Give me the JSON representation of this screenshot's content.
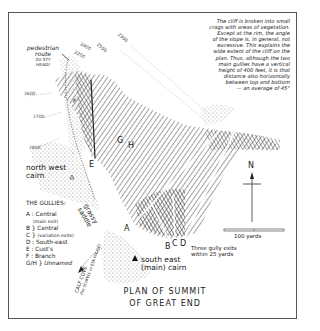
{
  "map": {
    "title_line1": "PLAN OF SUMMIT",
    "title_line2": "OF GREAT END",
    "note_lines": [
      "The cliff is broken into small",
      "crags with areas of vegetation.",
      "Except at the rim, the angle",
      "of the slope is, in general, not",
      "excessive.   This explains the",
      "wide extent of the cliff on the",
      "plan. Thus, although the two",
      "main gullies have a vertical",
      "height of 400 feet, it is that",
      "distance also horizontally",
      "between top and bottom",
      "— an average of 45°"
    ],
    "labels": {
      "pedestrian_route": "pedestrian",
      "pedestrian_route2": "route",
      "pedestrian_route3": "(to STY",
      "pedestrian_route4": "HEAD)",
      "north_west_cairn1": "north west",
      "north_west_cairn2": "cairn",
      "south_east_cairn1": "south east",
      "south_east_cairn2": "(main) cairn",
      "grassy_saddle1": "grassy",
      "grassy_saddle2": "saddle",
      "three_exits1": "Three gully exits",
      "three_exits2": "within 25 yards",
      "calf_cove": "CALF COVE",
      "calf_cove_sub": "(for SCAFELL or ESK HAUSE)",
      "scale": "100 yards",
      "north": "N"
    },
    "contours": [
      "2400",
      "2500",
      "2600",
      "2700",
      "2800",
      "2300",
      "2200"
    ],
    "gully_letters": [
      "A",
      "B",
      "C",
      "D",
      "E",
      "F",
      "G",
      "H"
    ],
    "legend": {
      "heading": "THE GULLIES:",
      "items": [
        {
          "key": "A",
          "label": "Central",
          "sub": "(main exit)"
        },
        {
          "key": "B",
          "label": "Central",
          "sub": ""
        },
        {
          "key": "C",
          "label": "",
          "sub": "(variation exits)"
        },
        {
          "key": "D",
          "label": "South-east",
          "sub": ""
        },
        {
          "key": "E",
          "label": "Cust's",
          "sub": ""
        },
        {
          "key": "F",
          "label": "Branch",
          "sub": ""
        },
        {
          "key": "G/H",
          "label": "Unnamed",
          "sub": ""
        }
      ]
    }
  }
}
